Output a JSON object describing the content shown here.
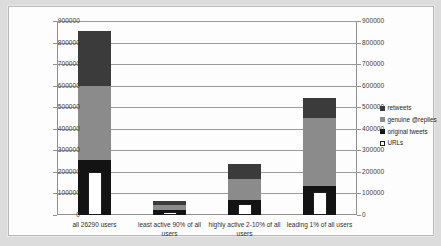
{
  "chart_data": {
    "type": "bar",
    "stacked": true,
    "title": "",
    "xlabel": "",
    "ylabel": "",
    "ylim": [
      0,
      900000
    ],
    "ytick_interval": 100000,
    "yticks": [
      "0",
      "100000",
      "200000",
      "300000",
      "400000",
      "500000",
      "600000",
      "700000",
      "800000",
      "900000"
    ],
    "dual_axis": true,
    "grid": true,
    "legend_position": "right",
    "categories": [
      "all 26290 users",
      "least active 90% of all users",
      "highly active 2-10% of all users",
      "leading 1% of all users"
    ],
    "series": [
      {
        "name": "original tweets",
        "color": "#131313",
        "values": [
          255000,
          25000,
          70000,
          135000
        ]
      },
      {
        "name": "genuine @replies",
        "color": "#8b8b8b",
        "values": [
          345000,
          20000,
          95000,
          315000
        ]
      },
      {
        "name": "retweets",
        "color": "#3b3b3b",
        "values": [
          255000,
          20000,
          70000,
          95000
        ]
      }
    ],
    "overlay_series": {
      "name": "URLs",
      "color": "#ffffff",
      "border": "#1d1d1d",
      "values": [
        200000,
        12000,
        50000,
        105000
      ]
    },
    "totals": [
      855000,
      65000,
      235000,
      545000
    ]
  },
  "legend": {
    "items": [
      {
        "label": "retweets",
        "swatch": "retweets"
      },
      {
        "label": "genuine @replies",
        "swatch": "replies"
      },
      {
        "label": "original tweets",
        "swatch": "original"
      },
      {
        "label": "URLs",
        "swatch": "urls"
      }
    ]
  }
}
